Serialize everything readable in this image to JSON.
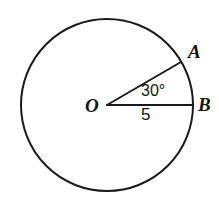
{
  "figure": {
    "type": "circle-with-central-angle",
    "background_color": "#ffffff",
    "stroke_color": "#1a1a1a",
    "labels": {
      "center": "O",
      "point_a": "A",
      "point_b": "B",
      "angle": "30°",
      "radius": "5"
    },
    "geometry": {
      "center_x": 107,
      "center_y": 105,
      "radius_px": 86,
      "angle_degrees": 30,
      "radius_length": 5,
      "point_a_x": 181,
      "point_a_y": 62,
      "point_b_x": 193,
      "point_b_y": 105,
      "stroke_width": 2
    }
  }
}
